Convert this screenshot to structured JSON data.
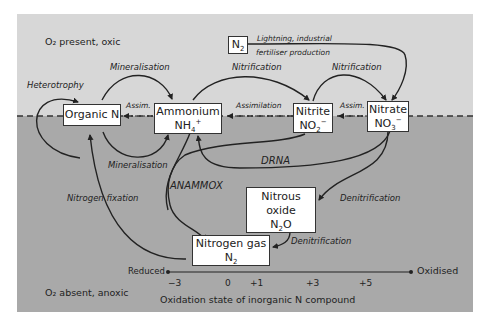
{
  "regions": {
    "top": "O₂ present, oxic",
    "bottom": "O₂ absent, anoxic"
  },
  "nodes": {
    "organic_n": {
      "name": "Organic N"
    },
    "ammonium": {
      "name": "Ammonium",
      "formula": "NH",
      "sub": "4",
      "sup": "+"
    },
    "nitrite": {
      "name": "Nitrite",
      "formula": "NO",
      "sub": "2",
      "sup": "−"
    },
    "nitrate": {
      "name": "Nitrate",
      "formula": "NO",
      "sub": "3",
      "sup": "−"
    },
    "n2_source": {
      "formula": "N",
      "sub": "2"
    },
    "nitrous_oxide": {
      "line1": "Nitrous",
      "line2": "oxide",
      "formula": "N",
      "sub": "2",
      "formula2": "O"
    },
    "nitrogen_gas": {
      "name": "Nitrogen gas",
      "formula": "N",
      "sub": "2"
    }
  },
  "processes": {
    "heterotrophy": "Heterotrophy",
    "mineralisation_top": "Mineralisation",
    "mineralisation_bottom": "Mineralisation",
    "nitrification_1": "Nitrification",
    "nitrification_2": "Nitrification",
    "lightning_line1": "Lightning, industrial",
    "lightning_line2": "fertiliser production",
    "assim_1": "Assim.",
    "assimilation": "Assimilation",
    "assim_2": "Assim.",
    "drna": "DRNA",
    "anammox": "ANAMMOX",
    "nitrogen_fixation": "Nitrogen fixation",
    "denitrification_1": "Denitrification",
    "denitrification_2": "Denitrification"
  },
  "axis": {
    "left_label": "Reduced",
    "right_label": "Oxidised",
    "ticks": [
      "−3",
      "0",
      "+1",
      "+3",
      "+5"
    ],
    "title": "Oxidation state of inorganic N compound"
  },
  "colors": {
    "oxic_bg": "#d7d7d7",
    "anoxic_bg": "#a9a9a9",
    "line": "#222222"
  }
}
